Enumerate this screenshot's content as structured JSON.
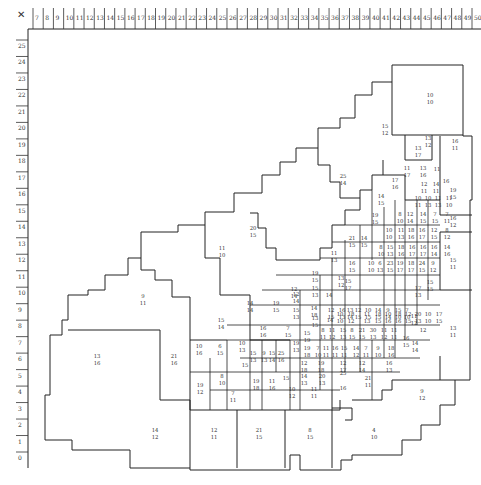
{
  "axes": {
    "corner_mark": "✕",
    "x_ticks": [
      "7",
      "8",
      "9",
      "10",
      "11",
      "12",
      "13",
      "14",
      "15",
      "16",
      "17",
      "18",
      "19",
      "20",
      "21",
      "22",
      "23",
      "24",
      "25",
      "26",
      "27",
      "28",
      "29",
      "30",
      "31",
      "32",
      "33",
      "34",
      "35",
      "36",
      "37",
      "38",
      "39",
      "40",
      "41",
      "42",
      "43",
      "44",
      "45",
      "46",
      "47",
      "48",
      "49",
      "50"
    ],
    "y_ticks": [
      "25",
      "24",
      "23",
      "22",
      "21",
      "20",
      "19",
      "18",
      "17",
      "16",
      "15",
      "14",
      "13",
      "12",
      "11",
      "10",
      "9",
      "8",
      "7",
      "6",
      "5",
      "4",
      "3",
      "2",
      "1",
      "0"
    ]
  },
  "regions": [
    {
      "a": "10",
      "b": "10",
      "x": 430,
      "y": 97
    },
    {
      "a": "15",
      "b": "12",
      "x": 385,
      "y": 128
    },
    {
      "a": "13",
      "b": "12",
      "x": 428,
      "y": 140
    },
    {
      "a": "16",
      "b": "11",
      "x": 455,
      "y": 143
    },
    {
      "a": "13",
      "b": "17",
      "x": 418,
      "y": 150
    },
    {
      "a": "11",
      "b": "17",
      "x": 407,
      "y": 170
    },
    {
      "a": "13",
      "b": "16",
      "x": 423,
      "y": 170
    },
    {
      "a": "25",
      "b": "14",
      "x": 343,
      "y": 178
    },
    {
      "a": "17",
      "b": "16",
      "x": 395,
      "y": 182
    },
    {
      "a": "12",
      "b": "11",
      "x": 424,
      "y": 186
    },
    {
      "a": "14",
      "b": "11",
      "x": 436,
      "y": 186
    },
    {
      "a": "11",
      "b": "",
      "x": 437,
      "y": 171
    },
    {
      "a": "16",
      "b": "",
      "x": 446,
      "y": 183
    },
    {
      "a": "19",
      "b": "15",
      "x": 453,
      "y": 192
    },
    {
      "a": "14",
      "b": "15",
      "x": 381,
      "y": 198
    },
    {
      "a": "10",
      "b": "11",
      "x": 418,
      "y": 200
    },
    {
      "a": "10",
      "b": "13",
      "x": 428,
      "y": 200
    },
    {
      "a": "11",
      "b": "13",
      "x": 438,
      "y": 200
    },
    {
      "a": "11",
      "b": "10",
      "x": 449,
      "y": 200
    },
    {
      "a": "19",
      "b": "15",
      "x": 375,
      "y": 217
    },
    {
      "a": "8",
      "b": "10",
      "x": 400,
      "y": 216
    },
    {
      "a": "12",
      "b": "14",
      "x": 410,
      "y": 216
    },
    {
      "a": "14",
      "b": "15",
      "x": 423,
      "y": 216
    },
    {
      "a": "7",
      "b": "15",
      "x": 435,
      "y": 216
    },
    {
      "a": "7",
      "b": "11",
      "x": 447,
      "y": 216
    },
    {
      "a": "16",
      "b": "12",
      "x": 453,
      "y": 220
    },
    {
      "a": "20",
      "b": "15",
      "x": 253,
      "y": 230
    },
    {
      "a": "11",
      "b": "10",
      "x": 222,
      "y": 250
    },
    {
      "a": "21",
      "b": "15",
      "x": 352,
      "y": 240
    },
    {
      "a": "14",
      "b": "15",
      "x": 364,
      "y": 240
    },
    {
      "a": "10",
      "b": "10",
      "x": 389,
      "y": 232
    },
    {
      "a": "11",
      "b": "13",
      "x": 401,
      "y": 232
    },
    {
      "a": "18",
      "b": "16",
      "x": 411,
      "y": 232
    },
    {
      "a": "16",
      "b": "17",
      "x": 422,
      "y": 232
    },
    {
      "a": "12",
      "b": "15",
      "x": 434,
      "y": 232
    },
    {
      "a": "8",
      "b": "12",
      "x": 447,
      "y": 232
    },
    {
      "a": "11",
      "b": "13",
      "x": 334,
      "y": 255
    },
    {
      "a": "8",
      "b": "10",
      "x": 381,
      "y": 249
    },
    {
      "a": "15",
      "b": "13",
      "x": 390,
      "y": 249
    },
    {
      "a": "18",
      "b": "16",
      "x": 401,
      "y": 249
    },
    {
      "a": "16",
      "b": "17",
      "x": 412,
      "y": 249
    },
    {
      "a": "16",
      "b": "17",
      "x": 423,
      "y": 249
    },
    {
      "a": "16",
      "b": "14",
      "x": 434,
      "y": 249
    },
    {
      "a": "14",
      "b": "16",
      "x": 447,
      "y": 249
    },
    {
      "a": "15",
      "b": "11",
      "x": 453,
      "y": 262
    },
    {
      "a": "16",
      "b": "15",
      "x": 352,
      "y": 265
    },
    {
      "a": "10",
      "b": "10",
      "x": 371,
      "y": 265
    },
    {
      "a": "6",
      "b": "13",
      "x": 380,
      "y": 265
    },
    {
      "a": "23",
      "b": "15",
      "x": 390,
      "y": 265
    },
    {
      "a": "19",
      "b": "17",
      "x": 400,
      "y": 265
    },
    {
      "a": "18",
      "b": "17",
      "x": 411,
      "y": 265
    },
    {
      "a": "24",
      "b": "15",
      "x": 422,
      "y": 265
    },
    {
      "a": "9",
      "b": "12",
      "x": 433,
      "y": 265
    },
    {
      "a": "9",
      "b": "11",
      "x": 143,
      "y": 298
    },
    {
      "a": "19",
      "b": "15",
      "x": 315,
      "y": 275
    },
    {
      "a": "13",
      "b": "12",
      "x": 341,
      "y": 280
    },
    {
      "a": "15",
      "b": "17",
      "x": 348,
      "y": 283
    },
    {
      "a": "17",
      "b": "13",
      "x": 418,
      "y": 290
    },
    {
      "a": "15",
      "b": "15",
      "x": 430,
      "y": 284
    },
    {
      "a": "12",
      "b": "14",
      "x": 294,
      "y": 291
    },
    {
      "a": "14",
      "b": "14",
      "x": 250,
      "y": 305
    },
    {
      "a": "19",
      "b": "15",
      "x": 276,
      "y": 305
    },
    {
      "a": "15",
      "b": "13",
      "x": 315,
      "y": 290
    },
    {
      "a": "14",
      "b": "",
      "x": 329,
      "y": 297
    },
    {
      "a": "12",
      "b": "14",
      "x": 296,
      "y": 296
    },
    {
      "a": "13",
      "b": "15",
      "x": 315,
      "y": 320
    },
    {
      "a": "14",
      "b": "",
      "x": 330,
      "y": 322
    },
    {
      "a": "10",
      "b": "10",
      "x": 340,
      "y": 316
    },
    {
      "a": "18",
      "b": "12",
      "x": 351,
      "y": 316
    },
    {
      "a": "11",
      "b": "13",
      "x": 367,
      "y": 316
    },
    {
      "a": "18",
      "b": "15",
      "x": 378,
      "y": 316
    },
    {
      "a": "10",
      "b": "16",
      "x": 388,
      "y": 316
    },
    {
      "a": "18",
      "b": "16",
      "x": 398,
      "y": 316
    },
    {
      "a": "12",
      "b": "15",
      "x": 408,
      "y": 316
    },
    {
      "a": "20",
      "b": "13",
      "x": 418,
      "y": 316
    },
    {
      "a": "10",
      "b": "10",
      "x": 428,
      "y": 316
    },
    {
      "a": "17",
      "b": "15",
      "x": 439,
      "y": 316
    },
    {
      "a": "15",
      "b": "14",
      "x": 221,
      "y": 322
    },
    {
      "a": "10",
      "b": "16",
      "x": 199,
      "y": 348
    },
    {
      "a": "16",
      "b": "16",
      "x": 263,
      "y": 330
    },
    {
      "a": "7",
      "b": "15",
      "x": 288,
      "y": 330
    },
    {
      "a": "19",
      "b": "13",
      "x": 296,
      "y": 345
    },
    {
      "a": "15",
      "b": "13",
      "x": 296,
      "y": 312
    },
    {
      "a": "14",
      "b": "18",
      "x": 314,
      "y": 310
    },
    {
      "a": "12",
      "b": "15",
      "x": 331,
      "y": 312
    },
    {
      "a": "16",
      "b": "13",
      "x": 342,
      "y": 312
    },
    {
      "a": "13",
      "b": "14",
      "x": 350,
      "y": 312
    },
    {
      "a": "12",
      "b": "15",
      "x": 358,
      "y": 312
    },
    {
      "a": "10",
      "b": "15",
      "x": 368,
      "y": 312
    },
    {
      "a": "14",
      "b": "15",
      "x": 378,
      "y": 312
    },
    {
      "a": "9",
      "b": "14",
      "x": 388,
      "y": 312
    },
    {
      "a": "15",
      "b": "10",
      "x": 398,
      "y": 312
    },
    {
      "a": "7",
      "b": "10",
      "x": 407,
      "y": 312
    },
    {
      "a": "11",
      "b": "12",
      "x": 414,
      "y": 318
    },
    {
      "a": "6",
      "b": "15",
      "x": 220,
      "y": 348
    },
    {
      "a": "10",
      "b": "13",
      "x": 242,
      "y": 345
    },
    {
      "a": "21",
      "b": "16",
      "x": 174,
      "y": 358
    },
    {
      "a": "13",
      "b": "16",
      "x": 97,
      "y": 358
    },
    {
      "a": "15",
      "b": "13",
      "x": 253,
      "y": 355
    },
    {
      "a": "9",
      "b": "13",
      "x": 264,
      "y": 355
    },
    {
      "a": "15",
      "b": "14",
      "x": 272,
      "y": 355
    },
    {
      "a": "25",
      "b": "16",
      "x": 281,
      "y": 355
    },
    {
      "a": "15",
      "b": "19",
      "x": 307,
      "y": 335
    },
    {
      "a": "8",
      "b": "11",
      "x": 323,
      "y": 332
    },
    {
      "a": "11",
      "b": "12",
      "x": 332,
      "y": 332
    },
    {
      "a": "15",
      "b": "13",
      "x": 343,
      "y": 332
    },
    {
      "a": "8",
      "b": "15",
      "x": 352,
      "y": 332
    },
    {
      "a": "21",
      "b": "15",
      "x": 362,
      "y": 332
    },
    {
      "a": "30",
      "b": "13",
      "x": 373,
      "y": 332
    },
    {
      "a": "11",
      "b": "12",
      "x": 384,
      "y": 332
    },
    {
      "a": "11",
      "b": "11",
      "x": 394,
      "y": 332
    },
    {
      "a": "16",
      "b": "15",
      "x": 406,
      "y": 340
    },
    {
      "a": "14",
      "b": "14",
      "x": 415,
      "y": 345
    },
    {
      "a": "12",
      "b": "",
      "x": 423,
      "y": 332
    },
    {
      "a": "15",
      "b": "",
      "x": 286,
      "y": 380
    },
    {
      "a": "15",
      "b": "",
      "x": 245,
      "y": 367
    },
    {
      "a": "19",
      "b": "18",
      "x": 307,
      "y": 350
    },
    {
      "a": "7",
      "b": "10",
      "x": 318,
      "y": 350
    },
    {
      "a": "11",
      "b": "11",
      "x": 326,
      "y": 350
    },
    {
      "a": "16",
      "b": "11",
      "x": 335,
      "y": 350
    },
    {
      "a": "15",
      "b": "11",
      "x": 344,
      "y": 350
    },
    {
      "a": "14",
      "b": "12",
      "x": 356,
      "y": 350
    },
    {
      "a": "7",
      "b": "11",
      "x": 366,
      "y": 350
    },
    {
      "a": "9",
      "b": "10",
      "x": 378,
      "y": 350
    },
    {
      "a": "18",
      "b": "16",
      "x": 391,
      "y": 350
    },
    {
      "a": "8",
      "b": "10",
      "x": 222,
      "y": 378
    },
    {
      "a": "19",
      "b": "12",
      "x": 200,
      "y": 387
    },
    {
      "a": "19",
      "b": "18",
      "x": 256,
      "y": 383
    },
    {
      "a": "11",
      "b": "16",
      "x": 272,
      "y": 383
    },
    {
      "a": "7",
      "b": "11",
      "x": 233,
      "y": 395
    },
    {
      "a": "12",
      "b": "18",
      "x": 304,
      "y": 365
    },
    {
      "a": "19",
      "b": "18",
      "x": 321,
      "y": 365
    },
    {
      "a": "12",
      "b": "17",
      "x": 343,
      "y": 365
    },
    {
      "a": "12",
      "b": "14",
      "x": 362,
      "y": 365
    },
    {
      "a": "16",
      "b": "13",
      "x": 389,
      "y": 365
    },
    {
      "a": "10",
      "b": "12",
      "x": 292,
      "y": 391
    },
    {
      "a": "11",
      "b": "11",
      "x": 314,
      "y": 391
    },
    {
      "a": "14",
      "b": "13",
      "x": 304,
      "y": 378
    },
    {
      "a": "20",
      "b": "13",
      "x": 322,
      "y": 378
    },
    {
      "a": "25",
      "b": "",
      "x": 343,
      "y": 375
    },
    {
      "a": "16",
      "b": "",
      "x": 343,
      "y": 390
    },
    {
      "a": "21",
      "b": "11",
      "x": 368,
      "y": 380
    },
    {
      "a": "9",
      "b": "12",
      "x": 422,
      "y": 393
    },
    {
      "a": "14",
      "b": "12",
      "x": 155,
      "y": 432
    },
    {
      "a": "12",
      "b": "11",
      "x": 214,
      "y": 432
    },
    {
      "a": "21",
      "b": "15",
      "x": 259,
      "y": 432
    },
    {
      "a": "8",
      "b": "15",
      "x": 310,
      "y": 432
    },
    {
      "a": "4",
      "b": "10",
      "x": 374,
      "y": 432
    },
    {
      "a": "13",
      "b": "11",
      "x": 453,
      "y": 330
    }
  ]
}
